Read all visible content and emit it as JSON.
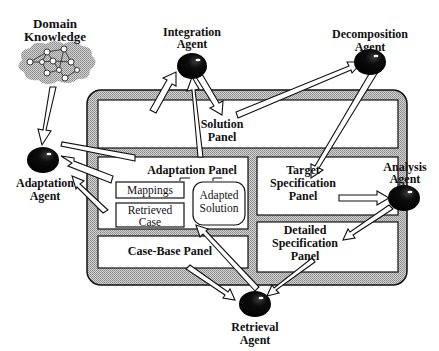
{
  "diagram": {
    "type": "agent-panel architecture",
    "colors": {
      "frame_fill": "#b8b8b8",
      "agent_fill": "#0a0a0a",
      "panel_fill": "#ffffff",
      "stroke": "#111111",
      "cloud_fill": "#bdbdbd"
    },
    "domain_knowledge": {
      "line1": "Domain",
      "line2": "Knowledge"
    },
    "agents": {
      "integration": {
        "line1": "Integration",
        "line2": "Agent"
      },
      "decomposition": {
        "line1": "Decomposition",
        "line2": "Agent"
      },
      "adaptation": {
        "line1": "Adaptation",
        "line2": "Agent"
      },
      "analysis": {
        "line1": "Analysis",
        "line2": "Agent"
      },
      "retrieval": {
        "line1": "Retrieval",
        "line2": "Agent"
      }
    },
    "panels": {
      "solution": {
        "line1": "Solution",
        "line2": "Panel"
      },
      "adaptation": {
        "title": "Adaptation Panel",
        "mappings": "Mappings",
        "retrieved_line1": "Retrieved",
        "retrieved_line2": "Case",
        "adapted_line1": "Adapted",
        "adapted_line2": "Solution"
      },
      "target_spec": {
        "line1": "Target",
        "line2": "Specification",
        "line3": "Panel"
      },
      "detailed_spec": {
        "line1": "Detailed",
        "line2": "Specification",
        "line3": "Panel"
      },
      "case_base": {
        "title": "Case-Base Panel"
      }
    },
    "connections": [
      {
        "from": "Domain Knowledge",
        "to": "Adaptation Agent"
      },
      {
        "from": "Adaptation Panel",
        "to": "Integration Agent"
      },
      {
        "from": "Solution Panel",
        "to": "Integration Agent"
      },
      {
        "from": "Integration Agent",
        "to": "Solution Panel"
      },
      {
        "from": "Solution Panel",
        "to": "Decomposition Agent"
      },
      {
        "from": "Decomposition Agent",
        "to": "Target Specification Panel"
      },
      {
        "from": "Adaptation Panel",
        "to": "Adaptation Agent"
      },
      {
        "from": "Mappings",
        "to": "Adaptation Agent"
      },
      {
        "from": "Retrieved Case",
        "to": "Adaptation Agent"
      },
      {
        "from": "Target Specification Panel",
        "to": "Analysis Agent"
      },
      {
        "from": "Analysis Agent",
        "to": "Detailed Specification Panel"
      },
      {
        "from": "Detailed Specification Panel",
        "to": "Retrieval Agent"
      },
      {
        "from": "Case-Base Panel",
        "to": "Retrieval Agent"
      },
      {
        "from": "Retrieval Agent",
        "to": "Retrieved Case"
      }
    ]
  }
}
